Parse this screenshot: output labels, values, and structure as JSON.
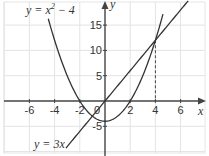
{
  "chart_data": {
    "type": "line",
    "title": "",
    "xlabel": "x",
    "ylabel": "y",
    "xlim": [
      -8.3,
      8.3
    ],
    "ylim": [
      -10.8,
      20
    ],
    "grid": true,
    "x_ticks": [
      -6,
      -4,
      -2,
      0,
      2,
      4,
      6
    ],
    "x_tick_labels": [
      "-6",
      "-4",
      "-2",
      "0",
      "2",
      "4",
      "6"
    ],
    "y_ticks": [
      -5,
      5,
      10,
      15
    ],
    "y_tick_labels": [
      "-5",
      "5",
      "10",
      "15"
    ],
    "series": [
      {
        "name": "y = x² − 4",
        "label_parts": {
          "base": "y = x",
          "sup": "2",
          "tail": " − 4"
        },
        "equation": "x^2 - 4",
        "x_range": [
          -4.5,
          4.6
        ],
        "color": "#333333"
      },
      {
        "name": "y = 3x",
        "equation": "3*x",
        "x_range": [
          -3.1,
          6.6
        ],
        "color": "#333333"
      }
    ],
    "annotations": [
      {
        "type": "dashed-vertical",
        "x": 4,
        "y_from": 0,
        "y_to": 12,
        "note": "intersection at (4, 12)"
      }
    ],
    "intersections": [
      [
        -1,
        -3
      ],
      [
        4,
        12
      ]
    ]
  },
  "labels": {
    "parabola": {
      "base": "y = x",
      "sup": "2",
      "tail": " − 4"
    },
    "line": "y = 3x",
    "x_axis": "x",
    "y_axis": "y"
  }
}
